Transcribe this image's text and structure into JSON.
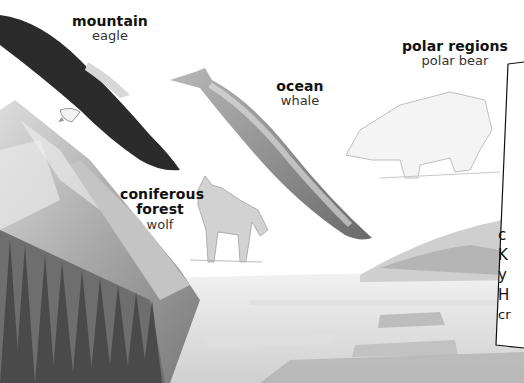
{
  "labels": {
    "mountain": {
      "habitat": "mountain",
      "animal": "eagle"
    },
    "ocean": {
      "habitat": "ocean",
      "animal": "whale"
    },
    "polar": {
      "habitat": "polar regions",
      "animal": "polar bear"
    },
    "forest": {
      "habitat_line1": "coniferous",
      "habitat_line2": "forest",
      "animal": "wolf"
    }
  },
  "side_box": {
    "lines": [
      "c",
      "K",
      "y",
      "H",
      "cr"
    ]
  },
  "colors": {
    "background": "#ffffff",
    "ink": "#111111",
    "ice": "#e6e6e6",
    "shadow": "#9a9a9a",
    "dark_feather": "#2b2b2b"
  }
}
